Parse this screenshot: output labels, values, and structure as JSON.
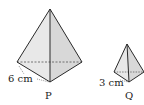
{
  "figure": {
    "pyramid_p": {
      "name": "P",
      "edge_label": "6 cm",
      "apex": [
        50,
        9
      ],
      "base_left": [
        17,
        62
      ],
      "base_right": [
        82,
        62
      ],
      "base_front": [
        50,
        82
      ]
    },
    "pyramid_q": {
      "name": "Q",
      "edge_label": "3 cm",
      "apex": [
        127,
        44
      ],
      "base_left": [
        114,
        72
      ],
      "base_right": [
        144,
        72
      ],
      "base_front": [
        129,
        82
      ]
    },
    "colors": {
      "line": "#2a2a2a",
      "face_left": "#e6e6e6",
      "face_right": "#d6d6d6",
      "dashed": "#555555"
    }
  }
}
